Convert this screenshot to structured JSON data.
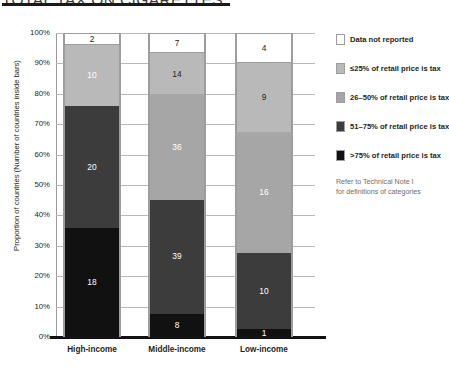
{
  "title": "TOTAL TAX ON CIGARETTES",
  "legend": {
    "items": [
      {
        "label": "Data not reported",
        "color": "#ffffff"
      },
      {
        "label": "≤25% of retail price is tax",
        "color": "#b9b9b9"
      },
      {
        "label": "26–50% of retail price is tax",
        "color": "#a6a6a6"
      },
      {
        "label": "51–75% of retail price is tax",
        "color": "#3c3c3c"
      },
      {
        "label": ">75% of retail price is tax",
        "color": "#111111"
      }
    ],
    "note_line1": "Refer to Technical Note I",
    "note_line2": "for definitions of categories"
  },
  "chart_data": {
    "type": "bar",
    "title": "TOTAL TAX ON CIGARETTES",
    "xlabel": "",
    "ylabel": "Proportion of countries (Number of countries inside bars)",
    "ylim": [
      0,
      100
    ],
    "yticks": [
      "0%",
      "10%",
      "20%",
      "30%",
      "40%",
      "50%",
      "60%",
      "70%",
      "80%",
      "90%",
      "100%"
    ],
    "grid": true,
    "stacked": true,
    "percent_stacked": true,
    "legend_position": "right",
    "categories": [
      "High-income",
      "Middle-income",
      "Low-income"
    ],
    "series": [
      {
        "name": ">75% of retail price is tax",
        "color": "#111111",
        "values": [
          18,
          8,
          1
        ]
      },
      {
        "name": "51–75% of retail price is tax",
        "color": "#3c3c3c",
        "values": [
          20,
          39,
          10
        ]
      },
      {
        "name": "26–50% of retail price is tax",
        "color": "#a6a6a6",
        "values": [
          0,
          36,
          16
        ]
      },
      {
        "name": "≤25% of retail price is tax",
        "color": "#b9b9b9",
        "values": [
          10,
          14,
          9
        ]
      },
      {
        "name": "Data not reported",
        "color": "#ffffff",
        "values": [
          2,
          7,
          4
        ]
      }
    ],
    "totals": [
      50,
      104,
      40
    ],
    "bars": [
      {
        "category": "High-income",
        "total": 50,
        "segments": [
          {
            "label": "18",
            "value": 18,
            "percent": 36.0,
            "color": "#111111",
            "text_color": "#ffffff"
          },
          {
            "label": "20",
            "value": 20,
            "percent": 40.0,
            "color": "#3c3c3c",
            "text_color": "#ffffff"
          },
          {
            "label": "10",
            "value": 10,
            "percent": 20.0,
            "color": "#b9b9b9",
            "text_color": "#ffffff"
          },
          {
            "label": "2",
            "value": 2,
            "percent": 4.0,
            "color": "#ffffff",
            "text_color": "#231f20"
          }
        ]
      },
      {
        "category": "Middle-income",
        "total": 104,
        "segments": [
          {
            "label": "8",
            "value": 8,
            "percent": 7.7,
            "color": "#111111",
            "text_color": "#ffffff"
          },
          {
            "label": "39",
            "value": 39,
            "percent": 37.5,
            "color": "#3c3c3c",
            "text_color": "#ffffff"
          },
          {
            "label": "36",
            "value": 36,
            "percent": 34.6,
            "color": "#a6a6a6",
            "text_color": "#ffffff"
          },
          {
            "label": "14",
            "value": 14,
            "percent": 13.5,
            "color": "#b9b9b9",
            "text_color": "#231f20"
          },
          {
            "label": "7",
            "value": 7,
            "percent": 6.7,
            "color": "#ffffff",
            "text_color": "#231f20"
          }
        ]
      },
      {
        "category": "Low-income",
        "total": 40,
        "segments": [
          {
            "label": "1",
            "value": 1,
            "percent": 2.5,
            "color": "#111111",
            "text_color": "#ffffff"
          },
          {
            "label": "10",
            "value": 10,
            "percent": 25.0,
            "color": "#3c3c3c",
            "text_color": "#ffffff"
          },
          {
            "label": "16",
            "value": 16,
            "percent": 40.0,
            "color": "#a6a6a6",
            "text_color": "#ffffff"
          },
          {
            "label": "9",
            "value": 9,
            "percent": 22.5,
            "color": "#b9b9b9",
            "text_color": "#231f20"
          },
          {
            "label": "4",
            "value": 4,
            "percent": 10.0,
            "color": "#ffffff",
            "text_color": "#231f20"
          }
        ]
      }
    ]
  }
}
